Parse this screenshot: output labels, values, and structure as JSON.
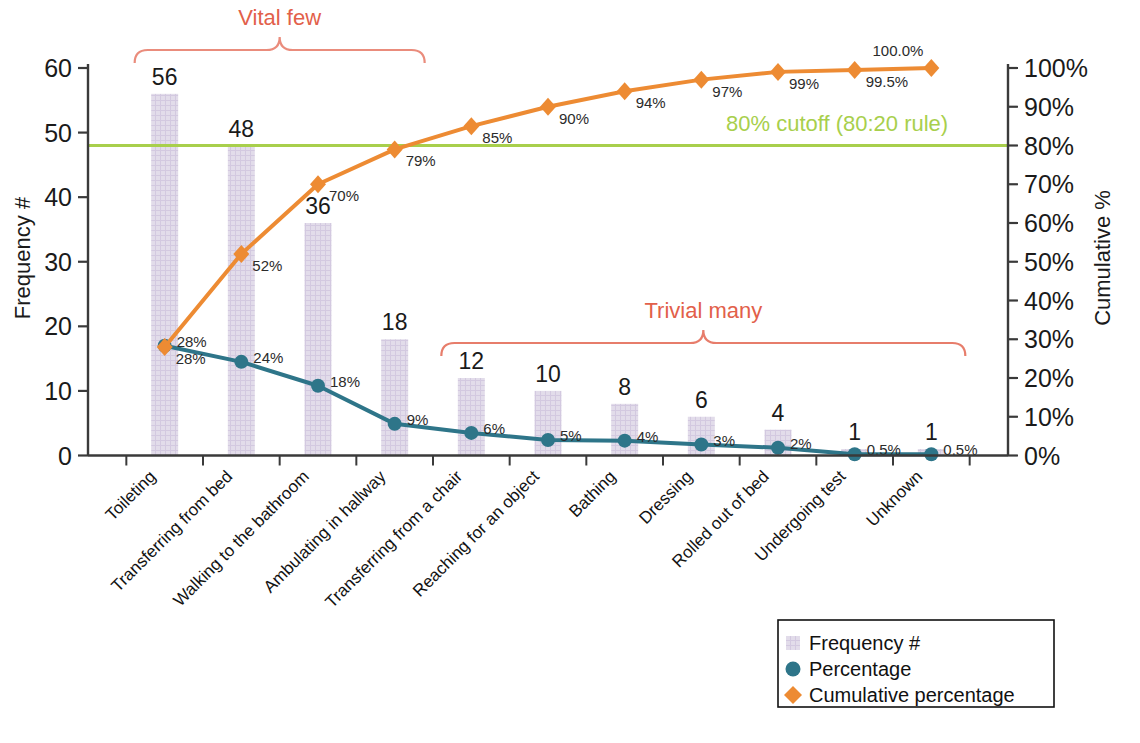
{
  "chart_data": {
    "type": "bar",
    "title": "",
    "subtitle": "",
    "xlabel": "",
    "ylabel": "Frequency #",
    "y2label": "Cumulative %",
    "ylim": [
      0,
      60
    ],
    "y2lim": [
      0,
      100
    ],
    "grid": false,
    "legend_position": "bottom-right",
    "categories": [
      "Toileting",
      "Transferring from bed",
      "Walking to the bathroom",
      "Ambulating in hallway",
      "Transferring from a chair",
      "Reaching for an object",
      "Bathing",
      "Dressing",
      "Rolled out of bed",
      "Undergoing test",
      "Unknown"
    ],
    "left_ticks": [
      "0",
      "10",
      "20",
      "30",
      "40",
      "50",
      "60"
    ],
    "right_ticks": [
      "0%",
      "10%",
      "20%",
      "30%",
      "40%",
      "50%",
      "60%",
      "70%",
      "80%",
      "90%",
      "100%"
    ],
    "series": [
      {
        "name": "Frequency #",
        "type": "bar",
        "axis": "left",
        "color": "#ded7e8",
        "values": [
          56,
          48,
          36,
          18,
          12,
          10,
          8,
          6,
          4,
          1,
          1
        ],
        "labels": [
          "56",
          "48",
          "36",
          "18",
          "12",
          "10",
          "8",
          "6",
          "4",
          "1",
          "1"
        ]
      },
      {
        "name": "Percentage",
        "type": "line",
        "axis": "left",
        "color": "#2e7589",
        "plotted_values": [
          17.0,
          14.5,
          10.8,
          4.9,
          3.5,
          2.4,
          2.3,
          1.7,
          1.2,
          0.2,
          0.2
        ],
        "values": [
          28,
          24,
          18,
          9,
          6,
          5,
          4,
          3,
          2,
          0.5,
          0.5
        ],
        "labels": [
          "28%",
          "24%",
          "18%",
          "9%",
          "6%",
          "5%",
          "4%",
          "3%",
          "2%",
          "0.5%",
          "0.5%"
        ]
      },
      {
        "name": "Cumulative percentage",
        "type": "line",
        "axis": "right",
        "color": "#ed8b33",
        "values": [
          28,
          52,
          70,
          79,
          85,
          90,
          94,
          97,
          99,
          99.5,
          100
        ],
        "labels": [
          "28%",
          "52%",
          "70%",
          "79%",
          "85%",
          "90%",
          "94%",
          "97%",
          "99%",
          "99.5%",
          "100.0%"
        ]
      }
    ],
    "reference_line": {
      "label": "80% cutoff (80:20 rule)",
      "value": 80,
      "axis": "right",
      "color": "#a8cf4c"
    },
    "annotations": [
      {
        "name": "vital-few",
        "label": "Vital few",
        "color": "#e2604a",
        "spans_categories": [
          0,
          3
        ]
      },
      {
        "name": "trivial-many",
        "label": "Trivial many",
        "color": "#e2604a",
        "spans_categories": [
          4,
          10
        ]
      }
    ]
  },
  "legend": {
    "items": [
      {
        "label": "Frequency #",
        "marker": "square-swatch",
        "color": "#ded7e8"
      },
      {
        "label": "Percentage",
        "marker": "circle-marker",
        "color": "#2e7589"
      },
      {
        "label": "Cumulative percentage",
        "marker": "diamond-marker",
        "color": "#ed8b33"
      }
    ]
  },
  "colors": {
    "bar": "#ded7e8",
    "percentage": "#2e7589",
    "cumulative": "#ed8b33",
    "cutoff": "#a8cf4c",
    "annotation": "#e2604a",
    "axis": "#3a3a3a",
    "text": "#1a1a1a"
  }
}
